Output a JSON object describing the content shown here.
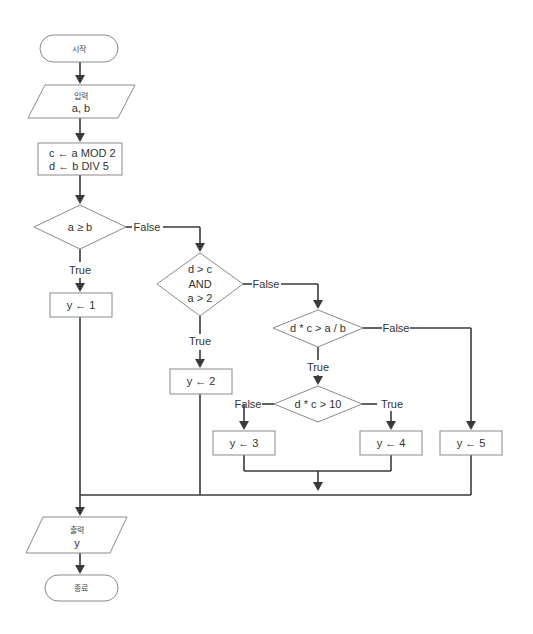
{
  "flowchart": {
    "start": "시작",
    "input": {
      "title": "입력",
      "vars": "a, b"
    },
    "process": {
      "line1": "c ← a MOD 2",
      "line2": "d  ← b DIV 5"
    },
    "decision1": {
      "condition": "a ≥ b",
      "true_label": "True",
      "false_label": "False"
    },
    "assign1": "y ← 1",
    "decision2": {
      "line1": "d > c",
      "line2": "AND",
      "line3": "a > 2",
      "true_label": "True",
      "false_label": "False"
    },
    "assign2": "y ← 2",
    "decision3": {
      "condition": "d * c > a / b",
      "true_label": "True",
      "false_label": "False"
    },
    "decision4": {
      "condition": "d * c > 10",
      "true_label": "True",
      "false_label": "False"
    },
    "assign3": "y ← 3",
    "assign4": "y ← 4",
    "assign5": "y ← 5",
    "output": {
      "title": "출력",
      "vars": "y"
    },
    "end": "종료"
  },
  "colors": {
    "line": "#3a3a3a",
    "border": "#8a8a8a",
    "text": "#333333",
    "fill": "#ffffff"
  }
}
